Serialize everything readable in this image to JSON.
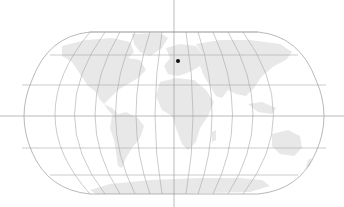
{
  "map": {
    "projection": "robinson-like world map",
    "colors": {
      "background": "#ffffff",
      "land": "#e8e8e8",
      "graticule": "#a8a8a8",
      "crosshair": "#9e9e9e",
      "marker": "#111111"
    },
    "crosshair": {
      "x": 174,
      "y": 116
    },
    "marker": {
      "x": 178,
      "y": 61,
      "radius": 2,
      "label": ""
    },
    "continents": [
      "North America",
      "South America",
      "Europe",
      "Africa",
      "Asia",
      "Australia",
      "Antarctica",
      "Greenland"
    ]
  }
}
